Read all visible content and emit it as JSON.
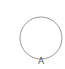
{
  "diagram": {
    "shape": "circle",
    "stroke_color": "#9a9a9a",
    "fill_color": "#ffffff",
    "label": "A"
  }
}
